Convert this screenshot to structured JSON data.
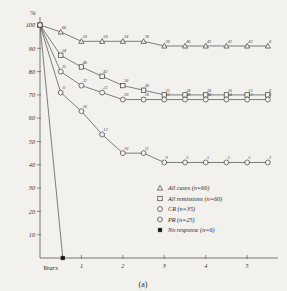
{
  "chart_data": {
    "type": "line",
    "title": "",
    "caption": "(a)",
    "xlabel": "Years",
    "ylabel": "%",
    "xlim": [
      0,
      5.6
    ],
    "ylim": [
      0,
      103
    ],
    "grid": false,
    "legend_position": "inside-bottom-right",
    "y_ticks": [
      100,
      90,
      80,
      70,
      60,
      50,
      40,
      30,
      20,
      10
    ],
    "y_tick_labels": [
      "100",
      "90",
      "80",
      "70",
      "60",
      "50",
      "40",
      "30",
      "20",
      "10"
    ],
    "x_ticks": [
      1,
      2,
      3,
      4,
      5
    ],
    "x_tick_labels": [
      "1",
      "2",
      "3",
      "4",
      "5"
    ],
    "series": [
      {
        "name": "All cases",
        "n": 66,
        "marker": "triangle",
        "legend_label": "All cases (n=66)",
        "x": [
          0,
          0.5,
          1.0,
          1.5,
          2.0,
          2.5,
          3.0,
          3.5,
          4.0,
          4.5,
          5.0,
          5.5
        ],
        "y": [
          100,
          97,
          93,
          93,
          93,
          93,
          91,
          91,
          91,
          91,
          91,
          91
        ],
        "point_labels": [
          "",
          "66",
          "59",
          "50",
          "38",
          "30",
          "26",
          "46",
          "43",
          "43",
          "42",
          "8"
        ]
      },
      {
        "name": "All remissions",
        "n": 60,
        "marker": "square",
        "legend_label": "All remissions (n=60)",
        "x": [
          0,
          0.5,
          1.0,
          1.5,
          2.0,
          2.5,
          3.0,
          3.5,
          4.0,
          4.5,
          5.0,
          5.5
        ],
        "y": [
          100,
          87,
          82,
          78,
          74,
          72,
          70,
          70,
          70,
          70,
          70,
          70
        ],
        "point_labels": [
          "",
          "54",
          "48",
          "42",
          "38",
          "38",
          "33",
          "24",
          "18",
          "16",
          "13",
          "6"
        ]
      },
      {
        "name": "CR",
        "n": 35,
        "marker": "circle",
        "legend_label": "CR (n=35)",
        "x": [
          0,
          0.5,
          1.0,
          1.5,
          2.0,
          2.5,
          3.0,
          3.5,
          4.0,
          4.5,
          5.0,
          5.5
        ],
        "y": [
          100,
          80,
          74,
          71,
          68,
          68,
          68,
          68,
          68,
          68,
          68,
          68
        ],
        "point_labels": [
          "",
          "35",
          "32",
          "22",
          "20",
          "16",
          "13",
          "20",
          "18",
          "14",
          "13",
          "6"
        ]
      },
      {
        "name": "PR",
        "n": 25,
        "marker": "hexagon",
        "legend_label": "PR (n=25)",
        "x": [
          0,
          0.5,
          1.0,
          1.5,
          2.0,
          2.5,
          3.0,
          3.5,
          4.0,
          4.5,
          5.0,
          5.5
        ],
        "y": [
          100,
          71,
          63,
          53,
          45,
          45,
          41,
          41,
          41,
          41,
          41,
          41
        ],
        "point_labels": [
          "",
          "11",
          "16",
          "12",
          "10",
          "11",
          "9",
          "5",
          "5",
          "5",
          "5",
          "2"
        ]
      },
      {
        "name": "No response",
        "n": 6,
        "marker": "filled-square",
        "legend_label": "No response (n=6)",
        "x": [
          0,
          0.55
        ],
        "y": [
          100,
          0
        ],
        "point_labels": [
          "",
          ""
        ]
      }
    ]
  },
  "legend": {
    "items": [
      {
        "marker": "triangle",
        "label": "All cases (n=66)",
        "name": "legend-item-all-cases"
      },
      {
        "marker": "square",
        "label": "All remissions (n=60)",
        "name": "legend-item-all-remissions"
      },
      {
        "marker": "circle",
        "label": "CR (n=35)",
        "name": "legend-item-cr"
      },
      {
        "marker": "hexagon",
        "label": "PR (n=25)",
        "name": "legend-item-pr"
      },
      {
        "marker": "filled-square",
        "label": "No response (n=6)",
        "name": "legend-item-no-response"
      }
    ]
  },
  "colors": {
    "background": "#f2f1ee",
    "ink": "#3d3d3d",
    "axis": "#5a5a5a"
  }
}
